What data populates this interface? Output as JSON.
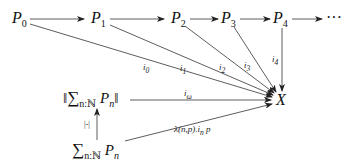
{
  "diagram": {
    "nodes": {
      "p0": {
        "base": "P",
        "sub": "0"
      },
      "p1": {
        "base": "P",
        "sub": "1"
      },
      "p2": {
        "base": "P",
        "sub": "2"
      },
      "p3": {
        "base": "P",
        "sub": "3"
      },
      "p4": {
        "base": "P",
        "sub": "4"
      },
      "dots": "···",
      "x": "X",
      "trunc": {
        "open": "‖",
        "sigma": "∑",
        "sub": "n:ℕ",
        "base": "P",
        "basesub": "n",
        "close": "‖"
      },
      "sum": {
        "sigma": "∑",
        "sub": "n:ℕ",
        "base": "P",
        "basesub": "n"
      }
    },
    "edges": [
      {
        "from": "P0",
        "to": "P1",
        "label": ""
      },
      {
        "from": "P1",
        "to": "P2",
        "label": ""
      },
      {
        "from": "P2",
        "to": "P3",
        "label": ""
      },
      {
        "from": "P3",
        "to": "P4",
        "label": ""
      },
      {
        "from": "P4",
        "to": "···",
        "label": ""
      },
      {
        "from": "P0",
        "to": "X",
        "label": "i0"
      },
      {
        "from": "P1",
        "to": "X",
        "label": "i1"
      },
      {
        "from": "P2",
        "to": "X",
        "label": "i2"
      },
      {
        "from": "P3",
        "to": "X",
        "label": "i3"
      },
      {
        "from": "P4",
        "to": "X",
        "label": "i4"
      },
      {
        "from": "‖∑ Pn‖",
        "to": "X",
        "label": "iω"
      },
      {
        "from": "∑ Pn",
        "to": "‖∑ Pn‖",
        "label": "|-|"
      },
      {
        "from": "∑ Pn",
        "to": "X",
        "label": "λ(n,p).in p"
      }
    ],
    "labels": {
      "i0": {
        "base": "i",
        "sub": "0"
      },
      "i1": {
        "base": "i",
        "sub": "1"
      },
      "i2": {
        "base": "i",
        "sub": "2"
      },
      "i3": {
        "base": "i",
        "sub": "3"
      },
      "i4": {
        "base": "i",
        "sub": "4"
      },
      "iw": {
        "base": "i",
        "sub": "ω"
      },
      "trunc_map": "|-|",
      "lambda": {
        "pre": "λ(n,p).i",
        "sub": "n",
        "post": " p"
      }
    }
  }
}
